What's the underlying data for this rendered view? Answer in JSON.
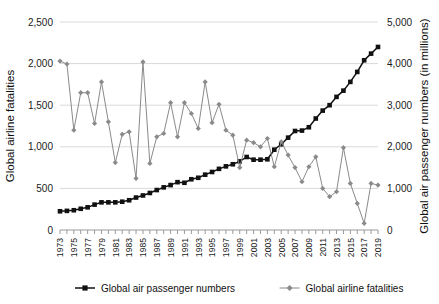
{
  "chart_data": {
    "type": "line",
    "title": "",
    "xlabel": "",
    "ylabel": "Global airline fatalities",
    "y2label": "Global air passenger numbers (in millions)",
    "ylim": [
      0,
      2500
    ],
    "y2lim": [
      0,
      5000
    ],
    "yticks": [
      "0",
      "500",
      "1,000",
      "1,500",
      "2,000",
      "2,500"
    ],
    "ytick_values": [
      0,
      500,
      1000,
      1500,
      2000,
      2500
    ],
    "y2ticks": [
      "0",
      "1,000",
      "2,000",
      "3,000",
      "4,000",
      "5,000"
    ],
    "y2tick_values": [
      0,
      1000,
      2000,
      3000,
      4000,
      5000
    ],
    "grid": true,
    "legend_position": "bottom",
    "x": [
      1973,
      1974,
      1975,
      1976,
      1977,
      1978,
      1979,
      1980,
      1981,
      1982,
      1983,
      1984,
      1985,
      1986,
      1987,
      1988,
      1989,
      1990,
      1991,
      1992,
      1993,
      1994,
      1995,
      1996,
      1997,
      1998,
      1999,
      2000,
      2001,
      2002,
      2003,
      2004,
      2005,
      2006,
      2007,
      2008,
      2009,
      2010,
      2011,
      2012,
      2013,
      2014,
      2015,
      2016,
      2017,
      2018,
      2019
    ],
    "xtick_labels": [
      "1973",
      "1975",
      "1977",
      "1979",
      "1981",
      "1983",
      "1985",
      "1987",
      "1989",
      "1991",
      "1993",
      "1995",
      "1997",
      "1999",
      "2001",
      "2003",
      "2005",
      "2007",
      "2009",
      "2011",
      "2013",
      "2015",
      "2017",
      "2019"
    ],
    "series": [
      {
        "name": "Global air passenger numbers",
        "axis": "right",
        "color": "#111111",
        "marker": "square",
        "values": [
          450,
          460,
          475,
          510,
          545,
          610,
          665,
          665,
          665,
          680,
          715,
          780,
          830,
          890,
          960,
          1025,
          1080,
          1150,
          1135,
          1220,
          1255,
          1330,
          1395,
          1470,
          1530,
          1580,
          1650,
          1755,
          1690,
          1690,
          1700,
          1930,
          2060,
          2220,
          2380,
          2390,
          2470,
          2680,
          2870,
          3000,
          3200,
          3350,
          3560,
          3800,
          4080,
          4240,
          4400
        ]
      },
      {
        "name": "Global airline fatalities",
        "axis": "left",
        "color": "#8a8a8a",
        "marker": "diamond",
        "values": [
          2030,
          1995,
          1200,
          1650,
          1650,
          1280,
          1780,
          1300,
          810,
          1150,
          1180,
          620,
          2020,
          800,
          1120,
          1160,
          1530,
          1120,
          1530,
          1400,
          1220,
          1780,
          1290,
          1510,
          1200,
          1140,
          750,
          1080,
          1050,
          1000,
          1100,
          760,
          1060,
          900,
          750,
          580,
          760,
          880,
          500,
          400,
          460,
          990,
          560,
          320,
          80,
          560,
          540
        ]
      }
    ]
  },
  "legend": {
    "items": [
      {
        "label": "Global air passenger numbers",
        "marker": "square",
        "color": "#111111"
      },
      {
        "label": "Global airline fatalities",
        "marker": "diamond",
        "color": "#8a8a8a"
      }
    ]
  }
}
